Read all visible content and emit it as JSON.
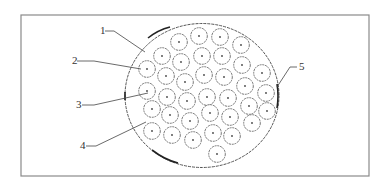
{
  "figure": {
    "type": "cable cross-section schematic",
    "frame": {
      "x": 21,
      "y": 15,
      "width": 348,
      "height": 161,
      "stroke": "#8a8a8a"
    },
    "outer_circle": {
      "cx": 202,
      "cy": 95.5,
      "rx": 77,
      "ry": 72,
      "stroke": "#555555"
    },
    "strand_radius": 8.3,
    "strands": [
      [
        179,
        42
      ],
      [
        199,
        36
      ],
      [
        220,
        37
      ],
      [
        241,
        45
      ],
      [
        162,
        56
      ],
      [
        181,
        62
      ],
      [
        202,
        56
      ],
      [
        222,
        56
      ],
      [
        242,
        65
      ],
      [
        147,
        69
      ],
      [
        166,
        76
      ],
      [
        185,
        82
      ],
      [
        204,
        75
      ],
      [
        224,
        77
      ],
      [
        245,
        86
      ],
      [
        262,
        73
      ],
      [
        147,
        91
      ],
      [
        167,
        97
      ],
      [
        187,
        101
      ],
      [
        207,
        97
      ],
      [
        228,
        98
      ],
      [
        249,
        106
      ],
      [
        266,
        93
      ],
      [
        152,
        109
      ],
      [
        170,
        115
      ],
      [
        190,
        121
      ],
      [
        210,
        113
      ],
      [
        230,
        117
      ],
      [
        267,
        111
      ],
      [
        152,
        131
      ],
      [
        172,
        135
      ],
      [
        193,
        140
      ],
      [
        213,
        133
      ],
      [
        232,
        136
      ],
      [
        252,
        123
      ],
      [
        217,
        154
      ]
    ],
    "labels": [
      {
        "text": "1",
        "x": 100,
        "y": 34,
        "line": "M105,31 L114,31 L145,52"
      },
      {
        "text": "2",
        "x": 72,
        "y": 64,
        "line": "M77,61 L94,61 L141,69"
      },
      {
        "text": "3",
        "x": 76,
        "y": 108,
        "line": "M82,105 L94,105 L148,93"
      },
      {
        "text": "4",
        "x": 80,
        "y": 149,
        "line": "M86,146 L96,146 L146,122"
      },
      {
        "text": "5",
        "x": 299,
        "y": 70,
        "line": "M297,67 L290,67 L277,87"
      }
    ]
  }
}
